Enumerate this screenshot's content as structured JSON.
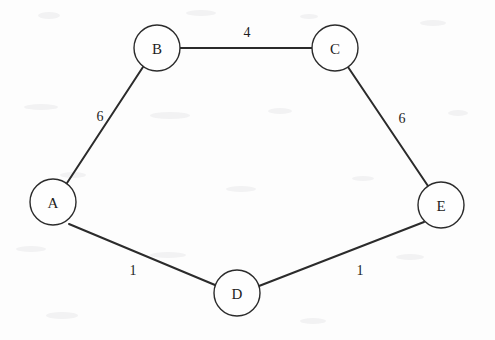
{
  "diagram": {
    "type": "node-link-graph",
    "background_color": "#fdfdfd",
    "stroke_color": "#2b2b2b",
    "nodes": [
      {
        "id": "A",
        "label": "A",
        "cx": 53,
        "cy": 202,
        "r": 23
      },
      {
        "id": "B",
        "label": "B",
        "cx": 157,
        "cy": 48,
        "r": 23
      },
      {
        "id": "C",
        "label": "C",
        "cx": 335,
        "cy": 48,
        "r": 23
      },
      {
        "id": "D",
        "label": "D",
        "cx": 237,
        "cy": 293,
        "r": 23
      },
      {
        "id": "E",
        "label": "E",
        "cx": 441,
        "cy": 205,
        "r": 23
      }
    ],
    "edges": [
      {
        "id": "B-C",
        "from": "B",
        "to": "C",
        "weight": "4",
        "label_x": 247,
        "label_y": 32
      },
      {
        "id": "A-B",
        "from": "A",
        "to": "B",
        "weight": "6",
        "label_x": 100,
        "label_y": 116
      },
      {
        "id": "C-E",
        "from": "C",
        "to": "E",
        "weight": "6",
        "label_x": 402,
        "label_y": 118
      },
      {
        "id": "A-D",
        "from": "A",
        "to": "D",
        "weight": "1",
        "label_x": 133,
        "label_y": 270
      },
      {
        "id": "D-E",
        "from": "D",
        "to": "E",
        "weight": "1",
        "label_x": 360,
        "label_y": 270
      }
    ]
  }
}
